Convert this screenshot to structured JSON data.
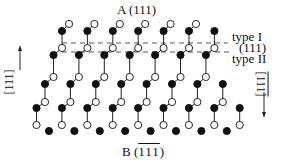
{
  "title_top": {
    "prefix": "A (",
    "index": "111",
    "suffix": ")"
  },
  "title_bottom": {
    "prefix": "B (",
    "index": "111",
    "suffix": ")",
    "overlined": true
  },
  "labels": {
    "type1": "type I",
    "plane": "(111)",
    "type2": "type II"
  },
  "left_axis": {
    "text": "[111]",
    "direction": "up"
  },
  "right_axis": {
    "text": "[111]",
    "overlined": true,
    "direction": "down"
  },
  "colors": {
    "filled_atom": "#111111",
    "open_atom": "#ffffff",
    "bond": "#222222",
    "dash": "#444444"
  },
  "lattice": {
    "period_x": 25.4,
    "rows": [
      {
        "open_y": 24,
        "open_x0": 69,
        "open_n": 6,
        "filled_y": 31,
        "filled_x0": 62,
        "filled_n": 7
      },
      {
        "open_y": 48,
        "open_x0": 62,
        "open_n": 7,
        "filled_y": 55,
        "filled_x0": 53.5,
        "filled_n": 7
      },
      {
        "open_y": 77,
        "open_x0": 53.5,
        "open_n": 7,
        "filled_y": 84,
        "filled_x0": 45,
        "filled_n": 8
      },
      {
        "open_y": 102,
        "open_x0": 45,
        "open_n": 8,
        "filled_y": 108,
        "filled_x0": 36.5,
        "filled_n": 9
      },
      {
        "open_y": 125,
        "open_x0": 36.5,
        "open_n": 9,
        "filled_y": 131,
        "filled_x0": 49,
        "filled_n": 8
      }
    ],
    "dashed_lines": [
      {
        "y": 43,
        "x1": 62,
        "x2": 228,
        "name": "type-I-cut"
      },
      {
        "y": 52,
        "x1": 62,
        "x2": 232,
        "name": "type-II-cut"
      }
    ]
  }
}
